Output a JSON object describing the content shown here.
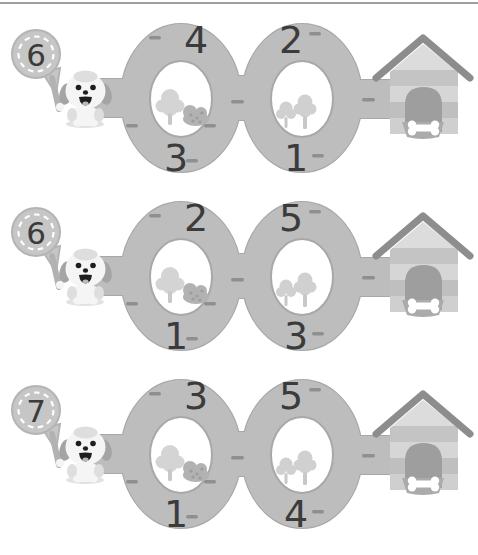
{
  "colors": {
    "track": "#bdbdbd",
    "track-edge": "#a8a8a8",
    "dash": "#8f8f8f",
    "number": "#3b3b3b",
    "badge": "#c6c6c6",
    "badge-edge": "#b4b4b4",
    "badge-dash": "#ffffff",
    "rule": "#9ba0a0",
    "roof": "#8d8d8d",
    "door": "#9e9e9e",
    "bowl": "#ababab",
    "bone": "#ffffff"
  },
  "icons": {
    "badge": "number-badge-sign",
    "dog": "puppy-face",
    "tree": "tree",
    "bush": "berry-bush",
    "house": "dog-house",
    "bone": "bone-in-bowl",
    "dash": "road-dash"
  },
  "rows": [
    {
      "badge": "6",
      "loop1_top": "4",
      "loop1_bottom": "3",
      "loop2_top": "2",
      "loop2_bottom": "1"
    },
    {
      "badge": "6",
      "loop1_top": "2",
      "loop1_bottom": "1",
      "loop2_top": "5",
      "loop2_bottom": "3"
    },
    {
      "badge": "7",
      "loop1_top": "3",
      "loop1_bottom": "1",
      "loop2_top": "5",
      "loop2_bottom": "4"
    }
  ]
}
